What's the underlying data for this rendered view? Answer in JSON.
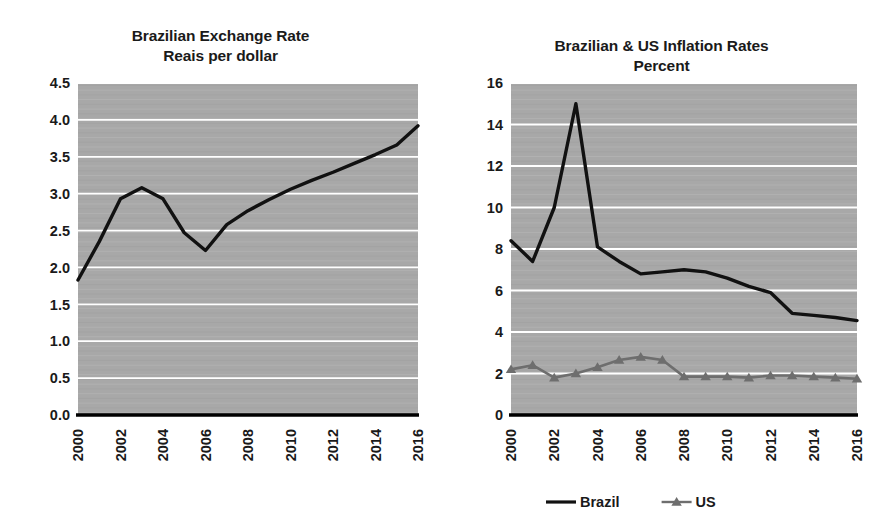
{
  "figure": {
    "background_color": "#ffffff",
    "plot_background_color": "#a8a8a8",
    "gridline_color": "#ffffff",
    "axis_color": "#000000"
  },
  "panels": [
    {
      "id": "exchange-rate",
      "title_line1": "Brazilian Exchange Rate",
      "title_line2": "Reais per dollar"
    },
    {
      "id": "inflation-rates",
      "title_line1": "Brazilian & US Inflation Rates",
      "title_line2": "Percent"
    }
  ],
  "legend": {
    "items": [
      {
        "label": "Brazil",
        "color": "#111111",
        "marker": "none"
      },
      {
        "label": "US",
        "color": "#6e6e6e",
        "marker": "triangle"
      }
    ]
  },
  "chart_data": [
    {
      "type": "line",
      "id": "exchange-rate",
      "title": "Brazilian Exchange Rate\nPercent",
      "subtitle": "Reais per dollar",
      "xlabel": "",
      "ylabel": "",
      "grid": true,
      "legend_position": "none",
      "xlim": [
        2000,
        2016
      ],
      "ylim": [
        0.0,
        4.5
      ],
      "yticks": [
        "0.0",
        "0.5",
        "1.0",
        "1.5",
        "2.0",
        "2.5",
        "3.0",
        "3.5",
        "4.0",
        "4.5"
      ],
      "xticks": [
        "2000",
        "2002",
        "2004",
        "2006",
        "2008",
        "2010",
        "2012",
        "2014",
        "2016"
      ],
      "x": [
        2000,
        2001,
        2002,
        2003,
        2004,
        2005,
        2006,
        2007,
        2008,
        2009,
        2010,
        2011,
        2012,
        2013,
        2014,
        2015,
        2016
      ],
      "series": [
        {
          "name": "Reais per dollar",
          "color": "#111111",
          "marker": "none",
          "values": [
            1.83,
            2.35,
            2.93,
            3.08,
            2.93,
            2.47,
            2.23,
            2.58,
            2.77,
            2.92,
            3.06,
            3.18,
            3.29,
            3.41,
            3.53,
            3.66,
            3.92
          ]
        }
      ]
    },
    {
      "type": "line",
      "id": "inflation-rates",
      "title": "Brazilian & US Inflation Rates",
      "subtitle": "Percent",
      "xlabel": "",
      "ylabel": "",
      "grid": true,
      "legend_position": "bottom",
      "xlim": [
        2000,
        2016
      ],
      "ylim": [
        0,
        16
      ],
      "yticks": [
        "0",
        "2",
        "4",
        "6",
        "8",
        "10",
        "12",
        "14",
        "16"
      ],
      "xticks": [
        "2000",
        "2002",
        "2004",
        "2006",
        "2008",
        "2010",
        "2012",
        "2014",
        "2016"
      ],
      "x": [
        2000,
        2001,
        2002,
        2003,
        2004,
        2005,
        2006,
        2007,
        2008,
        2009,
        2010,
        2011,
        2012,
        2013,
        2014,
        2015,
        2016
      ],
      "series": [
        {
          "name": "Brazil",
          "color": "#111111",
          "marker": "none",
          "values": [
            8.4,
            7.4,
            10.0,
            15.0,
            8.1,
            7.4,
            6.8,
            6.9,
            7.0,
            6.9,
            6.6,
            6.2,
            5.9,
            4.9,
            4.8,
            4.7,
            4.55
          ]
        },
        {
          "name": "US",
          "color": "#6e6e6e",
          "marker": "triangle",
          "values": [
            2.2,
            2.4,
            1.8,
            2.0,
            2.3,
            2.65,
            2.8,
            2.65,
            1.85,
            1.85,
            1.85,
            1.8,
            1.9,
            1.9,
            1.85,
            1.8,
            1.75
          ]
        }
      ]
    }
  ]
}
